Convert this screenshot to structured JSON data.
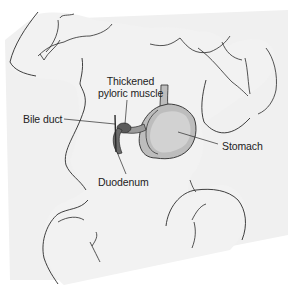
{
  "diagram": {
    "colors": {
      "background": "#ffffff",
      "band": "#efefef",
      "body_fill": "#f2f2f2",
      "outline": "#2a2a2a",
      "stomach_fill": "#bdbdbd",
      "stomach_inner": "#d6d6d6",
      "pylorus_fill": "#555555",
      "text": "#222222"
    },
    "labels": {
      "thickened_line1": "Thickened",
      "thickened_line2": "pyloric muscle",
      "bile_duct": "Bile duct",
      "stomach": "Stomach",
      "duodenum": "Duodenum"
    }
  }
}
